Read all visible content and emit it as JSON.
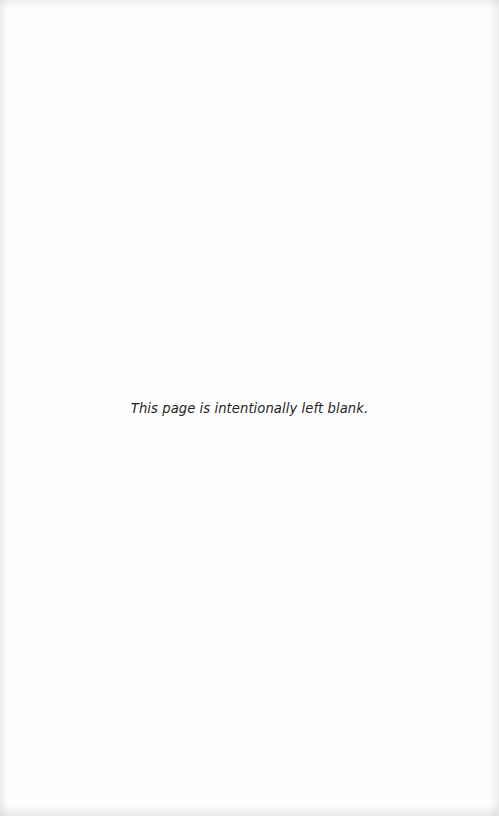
{
  "page": {
    "notice": "This page is intentionally left blank.",
    "background_color": "#fefefe",
    "text_color": "#1e1e1e"
  }
}
